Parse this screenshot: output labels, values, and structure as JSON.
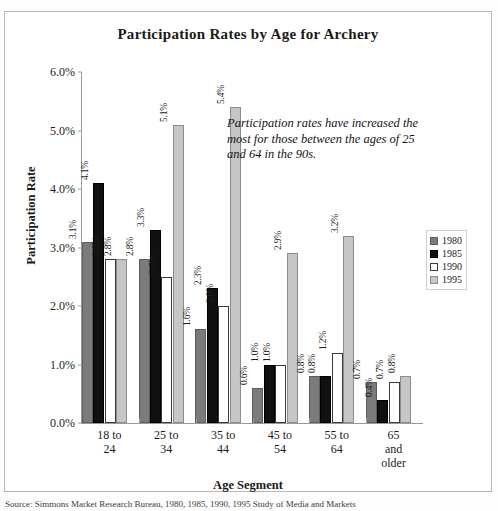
{
  "chart_data": {
    "type": "bar",
    "title": "Participation Rates by Age for Archery",
    "xlabel": "Age Segment",
    "ylabel": "Participation Rate",
    "ylim": [
      0,
      6
    ],
    "ytick_step": 1,
    "ytick_labels": [
      "0.0%",
      "1.0%",
      "2.0%",
      "3.0%",
      "4.0%",
      "5.0%",
      "6.0%"
    ],
    "grid": false,
    "legend_position": "right",
    "categories": [
      "18 to 24",
      "25 to 34",
      "35 to 44",
      "45 to 54",
      "55 to 64",
      "65 and older"
    ],
    "category_lines": [
      [
        "18 to",
        "24"
      ],
      [
        "25 to",
        "34"
      ],
      [
        "35 to",
        "44"
      ],
      [
        "45 to",
        "54"
      ],
      [
        "55 to",
        "64"
      ],
      [
        "65",
        "and",
        "older"
      ]
    ],
    "series": [
      {
        "name": "1980",
        "color": "#7b7b7b",
        "values": [
          3.1,
          2.8,
          1.6,
          0.6,
          0.8,
          0.7
        ],
        "labels": [
          "3.1%",
          "2.8%",
          "1.6%",
          "0.6%",
          "0.8%",
          "0.7%"
        ]
      },
      {
        "name": "1985",
        "color": "#111111",
        "values": [
          4.1,
          3.3,
          2.3,
          1.0,
          0.8,
          0.4
        ],
        "labels": [
          "4.1%",
          "3.3%",
          "2.3%",
          "1.0%",
          "0.8%",
          "0.4%"
        ]
      },
      {
        "name": "1990",
        "color": "#ffffff",
        "values": [
          2.8,
          2.5,
          2.0,
          1.0,
          1.2,
          0.7
        ],
        "labels": [
          "2.8%",
          "2.5%",
          "2.0%",
          "1.0%",
          "1.2%",
          "0.7%"
        ]
      },
      {
        "name": "1995",
        "color": "#c6c6c6",
        "values": [
          2.8,
          5.1,
          5.4,
          2.9,
          3.2,
          0.8
        ],
        "labels": [
          "2.8%",
          "5.1%",
          "5.4%",
          "2.9%",
          "3.2%",
          "0.8%"
        ]
      }
    ],
    "annotation": "Participation rates have increased the most for those between the ages of 25 and 64 in the 90s."
  },
  "source_note": "Source: Simmons Market Research Bureau, 1980, 1985, 1990, 1995 Study of Media and Markets"
}
